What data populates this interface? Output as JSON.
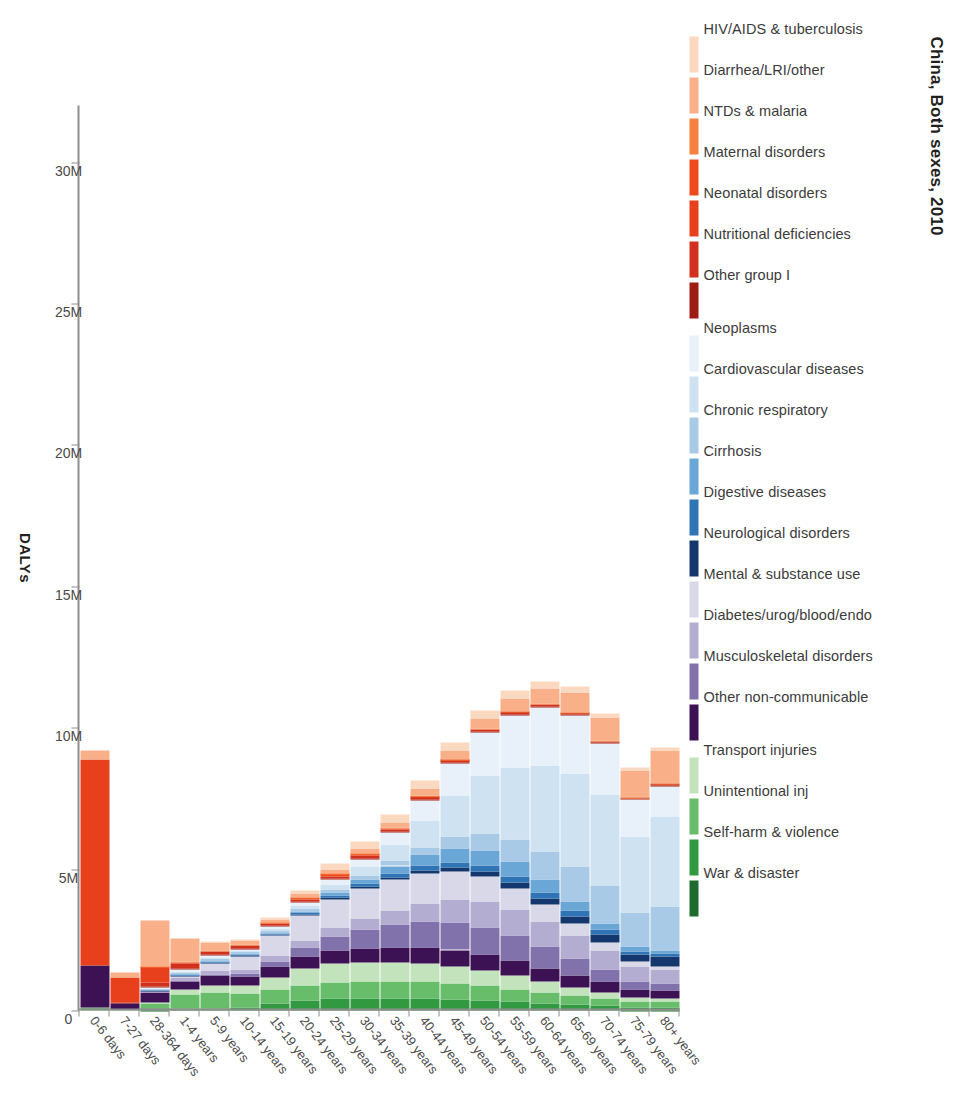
{
  "chart_data": {
    "type": "bar",
    "subtype": "stacked-horizontal-bar",
    "title": "China, Both sexes, 2010",
    "xlabel": "DALYs",
    "ylabel": "",
    "orientation": "horizontal-reversed",
    "xlim": [
      0,
      32000000
    ],
    "xticks": [
      0,
      5000000,
      10000000,
      15000000,
      20000000,
      25000000,
      30000000
    ],
    "xticklabels": [
      "0",
      "5M",
      "10M",
      "15M",
      "20M",
      "25M",
      "30M"
    ],
    "grid": false,
    "legend_position": "top",
    "categories": [
      "0-6 days",
      "7-27 days",
      "28-364 days",
      "1-4 years",
      "5-9 years",
      "10-14 years",
      "15-19 years",
      "20-24 years",
      "25-29 years",
      "30-34 years",
      "35-39 years",
      "40-44 years",
      "45-49 years",
      "50-54 years",
      "55-59 years",
      "60-64 years",
      "65-69 years",
      "70-74 years",
      "75-79 years",
      "80+ years"
    ],
    "series": [
      {
        "name": "HIV/AIDS & tuberculosis",
        "color": "#fbd9c1",
        "values": [
          0,
          0,
          0,
          0,
          30000,
          40000,
          70000,
          130000,
          200000,
          240000,
          260000,
          290000,
          300000,
          300000,
          270000,
          240000,
          200000,
          160000,
          120000,
          90000
        ]
      },
      {
        "name": "Diarrhea/LRI/other",
        "color": "#f9b089",
        "values": [
          330000,
          160000,
          1630000,
          820000,
          300000,
          140000,
          110000,
          120000,
          150000,
          170000,
          200000,
          240000,
          290000,
          360000,
          450000,
          560000,
          700000,
          830000,
          930000,
          1180000
        ]
      },
      {
        "name": "NTDs & malaria",
        "color": "#f5813f",
        "values": [
          0,
          0,
          20000,
          20000,
          20000,
          20000,
          20000,
          20000,
          20000,
          20000,
          20000,
          20000,
          20000,
          20000,
          20000,
          20000,
          20000,
          10000,
          10000,
          10000
        ]
      },
      {
        "name": "Maternal disorders",
        "color": "#ef4a1b",
        "values": [
          0,
          0,
          0,
          0,
          0,
          0,
          20000,
          60000,
          90000,
          70000,
          40000,
          20000,
          10000,
          0,
          0,
          0,
          0,
          0,
          0,
          0
        ]
      },
      {
        "name": "Neonatal disorders",
        "color": "#e8401c",
        "values": [
          7270000,
          900000,
          560000,
          60000,
          0,
          0,
          0,
          0,
          0,
          0,
          0,
          0,
          0,
          0,
          0,
          0,
          0,
          0,
          0,
          0
        ]
      },
      {
        "name": "Nutritional deficiencies",
        "color": "#d0301c",
        "values": [
          0,
          0,
          130000,
          170000,
          120000,
          90000,
          80000,
          80000,
          80000,
          80000,
          80000,
          90000,
          90000,
          90000,
          80000,
          80000,
          70000,
          60000,
          50000,
          50000
        ]
      },
      {
        "name": "Other group I",
        "color": "#9e1b12",
        "values": [
          0,
          10000,
          60000,
          40000,
          20000,
          20000,
          20000,
          20000,
          30000,
          30000,
          30000,
          30000,
          30000,
          30000,
          30000,
          30000,
          30000,
          20000,
          20000,
          20000
        ]
      },
      {
        "name": "Neoplasms",
        "color": "#e8f1f9",
        "values": [
          0,
          0,
          30000,
          60000,
          70000,
          60000,
          80000,
          110000,
          170000,
          260000,
          430000,
          720000,
          1120000,
          1520000,
          1850000,
          2060000,
          2060000,
          1790000,
          1300000,
          1100000
        ]
      },
      {
        "name": "Cardiovascular diseases",
        "color": "#cfe2f2",
        "values": [
          0,
          0,
          10000,
          20000,
          30000,
          40000,
          70000,
          110000,
          190000,
          320000,
          560000,
          940000,
          1480000,
          2050000,
          2550000,
          3020000,
          3290000,
          3240000,
          2680000,
          3160000
        ]
      },
      {
        "name": "Chronic respiratory",
        "color": "#a8cae6",
        "values": [
          0,
          0,
          30000,
          70000,
          100000,
          90000,
          90000,
          90000,
          110000,
          140000,
          190000,
          270000,
          400000,
          580000,
          790000,
          1010000,
          1210000,
          1320000,
          1230000,
          1570000
        ]
      },
      {
        "name": "Cirrhosis",
        "color": "#6aa6d6",
        "values": [
          0,
          0,
          0,
          10000,
          10000,
          10000,
          20000,
          40000,
          90000,
          160000,
          260000,
          390000,
          500000,
          550000,
          520000,
          440000,
          340000,
          240000,
          150000,
          110000
        ]
      },
      {
        "name": "Digestive diseases",
        "color": "#2f74b5",
        "values": [
          0,
          0,
          20000,
          30000,
          30000,
          30000,
          40000,
          60000,
          80000,
          110000,
          140000,
          170000,
          200000,
          220000,
          220000,
          210000,
          190000,
          160000,
          120000,
          110000
        ]
      },
      {
        "name": "Neurological disorders",
        "color": "#14386e",
        "values": [
          0,
          0,
          10000,
          20000,
          20000,
          20000,
          30000,
          40000,
          50000,
          60000,
          80000,
          100000,
          130000,
          160000,
          190000,
          220000,
          250000,
          270000,
          260000,
          330000
        ]
      },
      {
        "name": "Mental & substance use",
        "color": "#d9d8e8",
        "values": [
          0,
          0,
          0,
          60000,
          270000,
          480000,
          720000,
          900000,
          1010000,
          1060000,
          1080000,
          1060000,
          1000000,
          900000,
          760000,
          600000,
          440000,
          300000,
          180000,
          130000
        ]
      },
      {
        "name": "Diabetes/urog/blood/endo",
        "color": "#b3aed1",
        "values": [
          0,
          0,
          80000,
          110000,
          130000,
          140000,
          180000,
          230000,
          310000,
          400000,
          520000,
          660000,
          800000,
          900000,
          930000,
          900000,
          810000,
          680000,
          510000,
          500000
        ]
      },
      {
        "name": "Musculoskeletal disorders",
        "color": "#8272ac",
        "values": [
          0,
          0,
          0,
          20000,
          60000,
          110000,
          200000,
          330000,
          490000,
          650000,
          800000,
          910000,
          970000,
          960000,
          880000,
          750000,
          590000,
          430000,
          280000,
          220000
        ]
      },
      {
        "name": "Other non-communicable",
        "color": "#3c1254",
        "values": [
          1500000,
          220000,
          330000,
          300000,
          330000,
          330000,
          380000,
          430000,
          480000,
          510000,
          540000,
          560000,
          570000,
          560000,
          530000,
          490000,
          440000,
          380000,
          300000,
          280000
        ]
      },
      {
        "name": "Transport injuries",
        "color": "#c3e3bd",
        "values": [
          0,
          0,
          30000,
          160000,
          260000,
          290000,
          440000,
          600000,
          670000,
          680000,
          670000,
          650000,
          610000,
          550000,
          470000,
          380000,
          290000,
          210000,
          140000,
          110000
        ]
      },
      {
        "name": "Unintentional inj",
        "color": "#68bd6b",
        "values": [
          100000,
          40000,
          230000,
          520000,
          560000,
          470000,
          480000,
          520000,
          560000,
          580000,
          590000,
          590000,
          570000,
          520000,
          450000,
          380000,
          310000,
          250000,
          190000,
          220000
        ]
      },
      {
        "name": "Self-harm & violence",
        "color": "#31993f",
        "values": [
          0,
          0,
          20000,
          40000,
          60000,
          100000,
          220000,
          330000,
          380000,
          390000,
          390000,
          380000,
          360000,
          320000,
          280000,
          230000,
          190000,
          150000,
          110000,
          100000
        ]
      },
      {
        "name": "War & disaster",
        "color": "#1f6b2e",
        "values": [
          0,
          0,
          10000,
          20000,
          20000,
          20000,
          30000,
          30000,
          40000,
          40000,
          40000,
          40000,
          30000,
          30000,
          30000,
          20000,
          20000,
          20000,
          10000,
          10000
        ]
      }
    ]
  },
  "axis": {
    "x_title": "DALYs",
    "x_ticklabels": [
      "30M",
      "25M",
      "20M",
      "15M",
      "10M",
      "5M",
      "0"
    ],
    "y_ticklabels": [
      "80+ years",
      "75-79 years",
      "70-74 years",
      "65-69 years",
      "60-64 years",
      "55-59 years",
      "50-54 years",
      "45-49 years",
      "40-44 years",
      "35-39 years",
      "30-34 years",
      "25-29 years",
      "20-24 years",
      "15-19 years",
      "10-14 years",
      "5-9 years",
      "1-4 years",
      "28-364 days",
      "7-27 days",
      "0-6 days"
    ]
  }
}
